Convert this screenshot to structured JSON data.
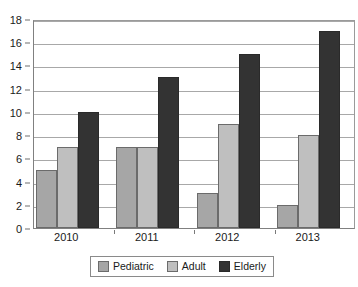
{
  "chart_data": {
    "type": "bar",
    "title": "",
    "subtitle": "",
    "xlabel": "",
    "ylabel": "",
    "categories": [
      "2010",
      "2011",
      "2012",
      "2013"
    ],
    "series": [
      {
        "name": "Pediatric",
        "color": "#a6a6a6",
        "values": [
          5,
          7,
          3,
          2
        ]
      },
      {
        "name": "Adult",
        "color": "#bfbfbf",
        "values": [
          7,
          7,
          9,
          8
        ]
      },
      {
        "name": "Elderly",
        "color": "#333333",
        "values": [
          10,
          13,
          15,
          17
        ]
      }
    ],
    "ylim": [
      0,
      18
    ],
    "ytick_step": 2,
    "yticks": [
      0,
      2,
      4,
      6,
      8,
      10,
      12,
      14,
      16,
      18
    ],
    "ytick_labels": [
      "0",
      "2",
      "4",
      "6",
      "8",
      "10",
      "12",
      "14",
      "16",
      "18"
    ],
    "grid": true,
    "grid_axis": "y",
    "legend": true,
    "legend_position": "bottom-center",
    "orientation": "vertical",
    "grouping": "grouped"
  }
}
